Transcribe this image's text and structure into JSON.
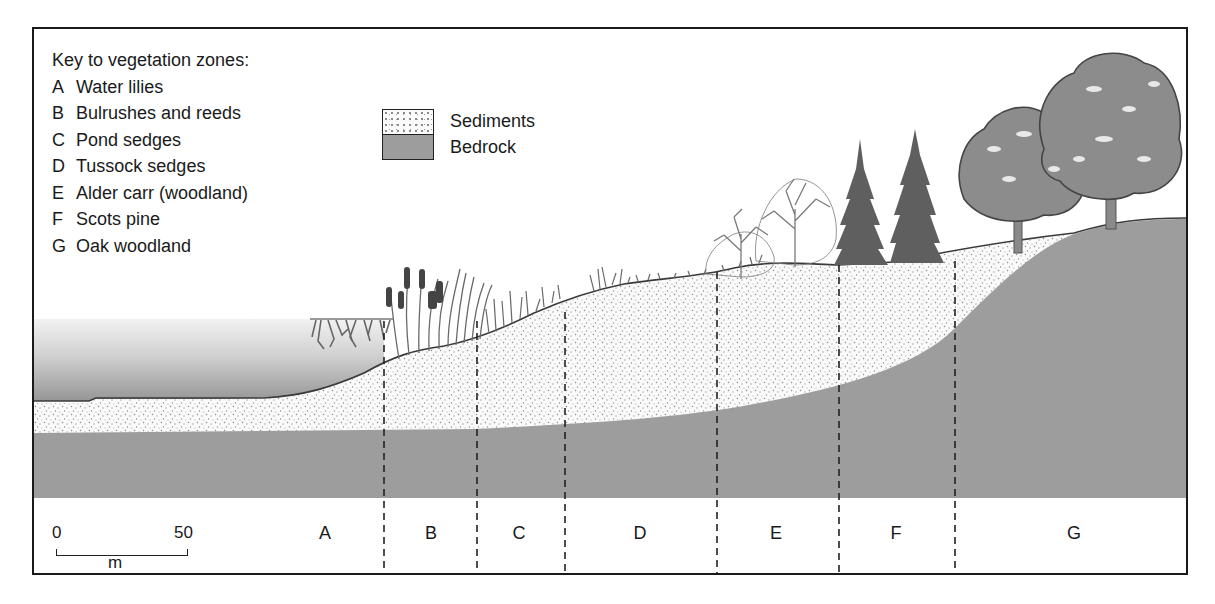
{
  "figure": {
    "type": "cross-section diagram"
  },
  "key": {
    "title": "Key to vegetation zones:",
    "items": [
      {
        "letter": "A",
        "label": "Water lilies"
      },
      {
        "letter": "B",
        "label": "Bulrushes and reeds"
      },
      {
        "letter": "C",
        "label": "Pond sedges"
      },
      {
        "letter": "D",
        "label": "Tussock sedges"
      },
      {
        "letter": "E",
        "label": "Alder carr (woodland)"
      },
      {
        "letter": "F",
        "label": "Scots pine"
      },
      {
        "letter": "G",
        "label": "Oak woodland"
      }
    ]
  },
  "legend": {
    "items": [
      {
        "label": "Sediments",
        "pattern": "stippled",
        "color": "#fafafa"
      },
      {
        "label": "Bedrock",
        "pattern": "solid",
        "color": "#9d9d9d"
      }
    ]
  },
  "scale_bar": {
    "start": "0",
    "end": "50",
    "unit": "m"
  },
  "zones": [
    {
      "letter": "A",
      "x_center": 291
    },
    {
      "letter": "B",
      "x_center": 397
    },
    {
      "letter": "C",
      "x_center": 485
    },
    {
      "letter": "D",
      "x_center": 606
    },
    {
      "letter": "E",
      "x_center": 742
    },
    {
      "letter": "F",
      "x_center": 862
    },
    {
      "letter": "G",
      "x_center": 1040
    }
  ],
  "zone_boundaries_x": [
    350,
    443,
    531,
    683,
    805,
    921
  ],
  "colors": {
    "frame": "#1a1a1a",
    "bedrock": "#9d9d9d",
    "sediment": "#fafafa",
    "water_top": "#f0f0f0",
    "water_bottom": "#9a9a9a",
    "vegetation_dark": "#5a5a5a",
    "tree_fill": "#8c8c8c"
  }
}
